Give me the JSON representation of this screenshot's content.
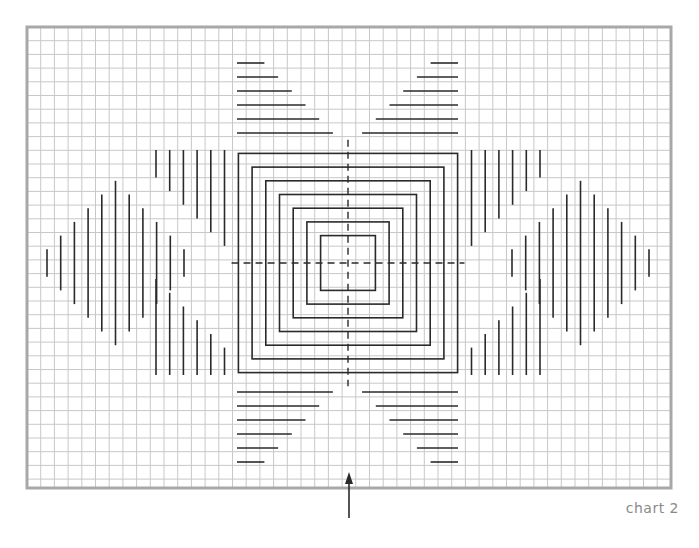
{
  "caption": "chart 2",
  "colors": {
    "grid": "#c8c8c8",
    "border": "#a8a8a8",
    "stroke": "#2a2a2a",
    "caption": "#8a8a8a"
  },
  "grid": {
    "x0": 27,
    "y0": 27,
    "x1": 671,
    "y1": 488,
    "cell": 13.7
  },
  "center": {
    "x": 348,
    "y": 263
  },
  "squares_half_cells": [
    2,
    3,
    4,
    5,
    6,
    7,
    8
  ],
  "top_bars": {
    "left_x": 237,
    "right_x": 458,
    "rows_y": [
      63,
      77,
      91,
      105,
      119,
      133
    ],
    "lengths_cells": [
      2,
      3,
      4,
      5,
      6,
      7
    ]
  },
  "bottom_bars": {
    "left_x": 237,
    "right_x": 458,
    "rows_y": [
      392,
      406,
      420,
      434,
      448,
      462
    ],
    "lengths_cells": [
      7,
      6,
      5,
      4,
      3,
      2
    ]
  },
  "arrow": {
    "x": 349,
    "y_tail": 518,
    "y_head": 472
  }
}
